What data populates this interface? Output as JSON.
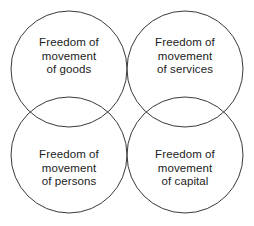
{
  "diagram": {
    "type": "venn-four-circles",
    "background_color": "#ffffff",
    "stroke_color": "#3a3a3a",
    "text_color": "#222222",
    "circles": [
      {
        "id": "goods",
        "name": "freedom-of-movement-of-goods",
        "cx": 69,
        "cy": 69,
        "r": 58,
        "lines": [
          "Freedom of",
          "movement",
          "of goods"
        ]
      },
      {
        "id": "services",
        "name": "freedom-of-movement-of-services",
        "cx": 185,
        "cy": 69,
        "r": 58,
        "lines": [
          "Freedom of",
          "movement",
          "of services"
        ]
      },
      {
        "id": "persons",
        "name": "freedom-of-movement-of-persons",
        "cx": 69,
        "cy": 155,
        "r": 58,
        "lines": [
          "Freedom of",
          "movement",
          "of persons"
        ]
      },
      {
        "id": "capital",
        "name": "freedom-of-movement-of-capital",
        "cx": 185,
        "cy": 155,
        "r": 58,
        "lines": [
          "Freedom of",
          "movement",
          "of capital"
        ]
      }
    ]
  }
}
